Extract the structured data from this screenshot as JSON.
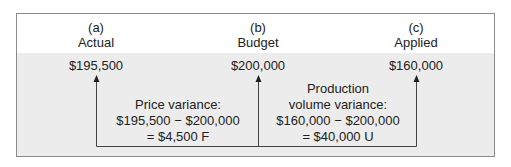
{
  "columns": [
    {
      "letter": "(a)",
      "label": "Actual",
      "amount": "$195,500"
    },
    {
      "letter": "(b)",
      "label": "Budget",
      "amount": "$200,000"
    },
    {
      "letter": "(c)",
      "label": "Applied",
      "amount": "$160,000"
    }
  ],
  "variances": {
    "price": {
      "line1": "Price variance:",
      "line2": "$195,500 − $200,000",
      "line3": "= $4,500 F"
    },
    "volume": {
      "line0": "Production",
      "line1": "volume variance:",
      "line2": "$160,000 − $200,000",
      "line3": "= $40,000 U"
    }
  },
  "colors": {
    "border": "#8a8a8a",
    "shade": "#ececec",
    "line": "#444444"
  }
}
